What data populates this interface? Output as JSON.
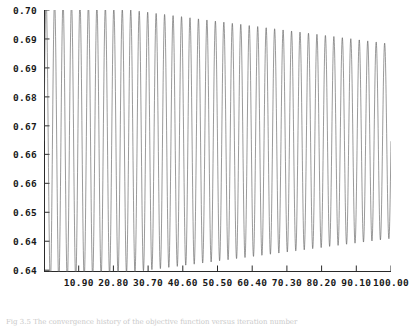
{
  "figure": {
    "background_color": "#ffffff",
    "caption": "Fig 3.5  The convergence history of the objective function versus iteration number"
  },
  "chart_data": {
    "type": "line",
    "title": "",
    "subtitle": "",
    "xlabel": "",
    "ylabel": "",
    "grid": false,
    "legend": null,
    "legend_position": "none",
    "line_color": "#555555",
    "line_width": 0.6,
    "xlim": [
      1.0,
      100.0
    ],
    "ylim": [
      0.6375,
      0.6954
    ],
    "x_tick_labels": [
      "10.90",
      "20.80",
      "30.70",
      "40.60",
      "50.50",
      "60.40",
      "70.30",
      "80.20",
      "90.10",
      "100.00"
    ],
    "x_tick_values": [
      10.9,
      20.8,
      30.7,
      40.6,
      50.5,
      60.4,
      70.3,
      80.2,
      90.1,
      100.0
    ],
    "y_tick_labels": [
      "0.70",
      "0.69",
      "0.69",
      "0.68",
      "0.67",
      "0.66",
      "0.66",
      "0.65",
      "0.64",
      "0.64"
    ],
    "y_tick_values": [
      0.6954,
      0.689,
      0.6826,
      0.6762,
      0.6698,
      0.6635,
      0.6571,
      0.6507,
      0.6443,
      0.6379
    ],
    "series": [
      {
        "name": "objective",
        "center": 0.6664,
        "amplitude_start": 0.0315,
        "amplitude_end": 0.0215,
        "cycles": 41,
        "samples": 2400
      }
    ]
  }
}
